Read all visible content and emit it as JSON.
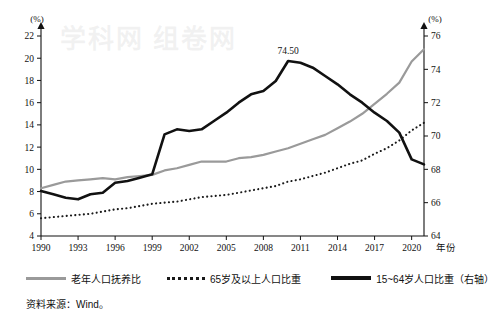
{
  "figure": {
    "left_axis_unit": "(%)",
    "right_axis_unit": "(%)",
    "x_axis_name": "年份",
    "source_note": "资料来源：Wind。",
    "peak_annotation": "74.50",
    "watermark_text": "学科网 组卷网"
  },
  "legend": {
    "items": [
      {
        "label": "老年人口抚养比",
        "style": "solid-gray",
        "color": "#9a9a9a"
      },
      {
        "label": "65岁及以上人口比重",
        "style": "dotted-black",
        "color": "#1a1a1a"
      },
      {
        "label": "15~64岁人口比重（右轴）",
        "style": "solid-black",
        "color": "#111111"
      }
    ]
  },
  "chart_data": {
    "type": "line",
    "title": "",
    "subtitle": "",
    "xlabel": "年份",
    "ylabel": "(%)",
    "y2label": "(%)",
    "grid": false,
    "legend_position": "bottom",
    "xlim": [
      1990,
      2021
    ],
    "ylim": [
      4,
      22
    ],
    "y2lim": [
      64,
      76
    ],
    "xticks": [
      "1990",
      "1993",
      "1996",
      "1999",
      "2002",
      "2005",
      "2008",
      "2011",
      "2014",
      "2017",
      "2020"
    ],
    "yticks": [
      "4",
      "6",
      "8",
      "10",
      "12",
      "14",
      "16",
      "18",
      "20",
      "22"
    ],
    "y2ticks": [
      "64",
      "66",
      "68",
      "70",
      "72",
      "74",
      "76"
    ],
    "annotations": [
      {
        "text": "74.50",
        "series": "15~64岁人口比重（右轴）",
        "x": 2010,
        "y": 74.5
      }
    ],
    "x": [
      1990,
      1991,
      1992,
      1993,
      1994,
      1995,
      1996,
      1997,
      1998,
      1999,
      2000,
      2001,
      2002,
      2003,
      2004,
      2005,
      2006,
      2007,
      2008,
      2009,
      2010,
      2011,
      2012,
      2013,
      2014,
      2015,
      2016,
      2017,
      2018,
      2019,
      2020,
      2021
    ],
    "series": [
      {
        "name": "老年人口抚养比",
        "axis": "left",
        "style": "solid",
        "color": "#9a9a9a",
        "values": [
          8.3,
          8.6,
          8.9,
          9.0,
          9.1,
          9.2,
          9.1,
          9.3,
          9.4,
          9.5,
          9.9,
          10.1,
          10.4,
          10.7,
          10.7,
          10.7,
          11.0,
          11.1,
          11.3,
          11.6,
          11.9,
          12.3,
          12.7,
          13.1,
          13.7,
          14.3,
          15.0,
          15.9,
          16.8,
          17.8,
          19.7,
          20.8
        ]
      },
      {
        "name": "65岁及以上人口比重",
        "axis": "left",
        "style": "dotted",
        "color": "#1a1a1a",
        "values": [
          5.6,
          5.7,
          5.8,
          5.9,
          6.0,
          6.2,
          6.4,
          6.5,
          6.7,
          6.9,
          7.0,
          7.1,
          7.3,
          7.5,
          7.6,
          7.7,
          7.9,
          8.1,
          8.3,
          8.5,
          8.9,
          9.1,
          9.4,
          9.7,
          10.1,
          10.5,
          10.8,
          11.4,
          11.9,
          12.6,
          13.5,
          14.2
        ]
      },
      {
        "name": "15~64岁人口比重（右轴）",
        "axis": "right",
        "style": "solid",
        "color": "#111111",
        "values": [
          66.7,
          66.5,
          66.3,
          66.2,
          66.5,
          66.6,
          67.2,
          67.3,
          67.5,
          67.7,
          70.1,
          70.4,
          70.3,
          70.4,
          70.9,
          71.4,
          72.0,
          72.5,
          72.7,
          73.3,
          74.5,
          74.4,
          74.1,
          73.6,
          73.1,
          72.5,
          72.0,
          71.4,
          70.9,
          70.2,
          68.6,
          68.3
        ]
      }
    ]
  }
}
